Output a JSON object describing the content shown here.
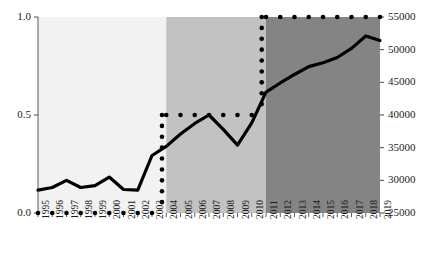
{
  "chart_data": {
    "type": "line",
    "title": "",
    "subtitle": "",
    "xlabel": "",
    "ylabel": "",
    "grid": false,
    "legend": "none",
    "x": [
      1995,
      1996,
      1997,
      1998,
      1999,
      2000,
      2001,
      2002,
      2003,
      2004,
      2005,
      2006,
      2007,
      2008,
      2009,
      2010,
      2011,
      2012,
      2013,
      2014,
      2015,
      2016,
      2017,
      2018,
      2019
    ],
    "categories": [
      "1995",
      "1996",
      "1997",
      "1998",
      "1999",
      "2000",
      "2001",
      "2002",
      "2003",
      "2004",
      "2005",
      "2006",
      "2007",
      "2008",
      "2009",
      "2010",
      "2011",
      "2012",
      "2013",
      "2014",
      "2015",
      "2016",
      "2017",
      "2018",
      "2019"
    ],
    "axes": {
      "left": {
        "ylim": [
          0.0,
          1.0
        ],
        "ticks": [
          0.0,
          0.5,
          1.0
        ],
        "tick_labels": [
          "0.0",
          "0.5",
          "1.0"
        ]
      },
      "right": {
        "ylim": [
          25000,
          55000
        ],
        "ticks": [
          25000,
          30000,
          35000,
          40000,
          45000,
          50000,
          55000
        ],
        "tick_labels": [
          "25000",
          "30000",
          "35000",
          "40000",
          "45000",
          "50000",
          "55000"
        ]
      }
    },
    "series": [
      {
        "name": "value-line",
        "axis": "right",
        "style": "solid",
        "color": "#000000",
        "values": [
          28500,
          28900,
          30000,
          28900,
          29200,
          30500,
          28600,
          28500,
          33800,
          35200,
          37100,
          38700,
          40000,
          37800,
          35400,
          38800,
          43500,
          44900,
          46200,
          47400,
          48000,
          48800,
          50200,
          52100,
          51400
        ]
      },
      {
        "name": "regime-step",
        "axis": "left",
        "style": "dotted",
        "color": "#000000",
        "values": [
          0.0,
          0.0,
          0.0,
          0.0,
          0.0,
          0.0,
          0.0,
          0.0,
          0.0,
          0.5,
          0.5,
          0.5,
          0.5,
          0.5,
          0.5,
          0.5,
          1.0,
          1.0,
          1.0,
          1.0,
          1.0,
          1.0,
          1.0,
          1.0,
          1.0
        ]
      }
    ],
    "bands": [
      {
        "name": "band-early",
        "from": 1995,
        "to": 2004,
        "color": "#f2f2f2"
      },
      {
        "name": "band-middle",
        "from": 2004,
        "to": 2011,
        "color": "#c2c2c2"
      },
      {
        "name": "band-late",
        "from": 2011,
        "to": 2019,
        "color": "#848484"
      }
    ]
  }
}
